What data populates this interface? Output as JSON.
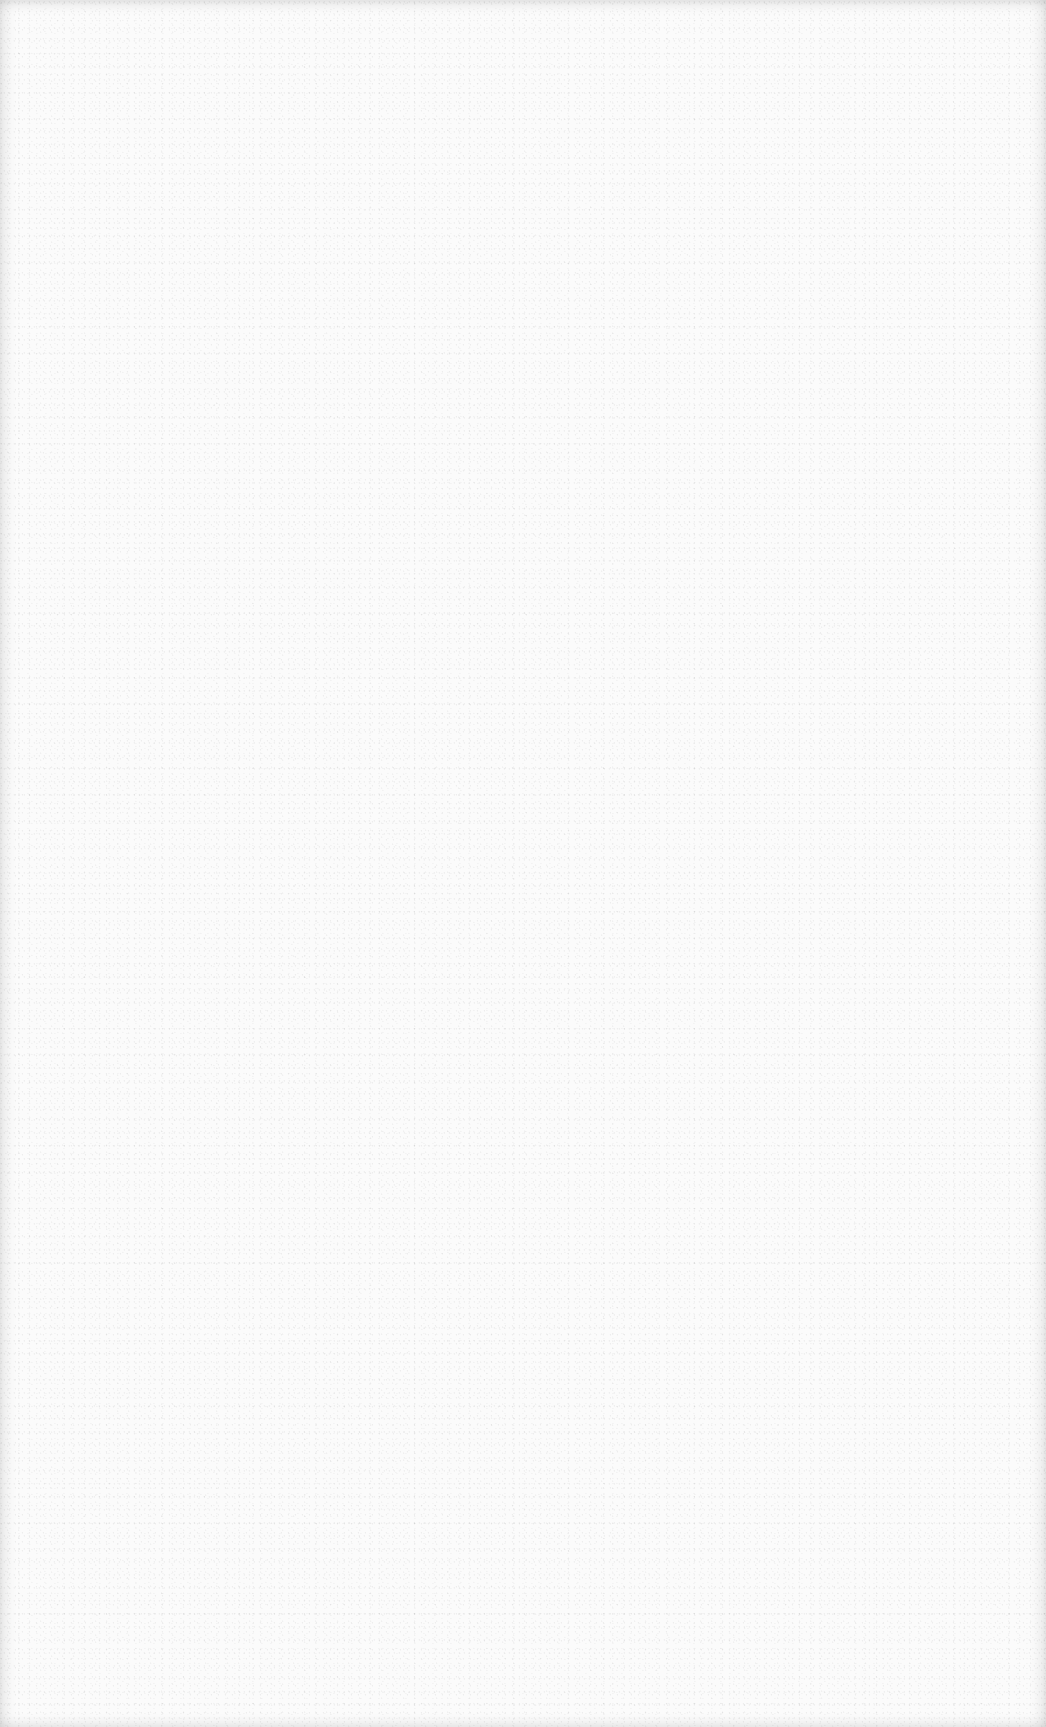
{
  "page": {
    "background_color": "#fbfbfb",
    "edge_shade_color": "#e6e6e6",
    "content": []
  }
}
